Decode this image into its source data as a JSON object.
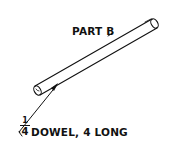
{
  "drawing": {
    "part_label": "PART B",
    "callout": {
      "fraction_numerator": "1",
      "fraction_denominator": "4",
      "text": "DOWEL, 4 LONG"
    },
    "stroke_color": "#111111",
    "background": "#ffffff"
  }
}
